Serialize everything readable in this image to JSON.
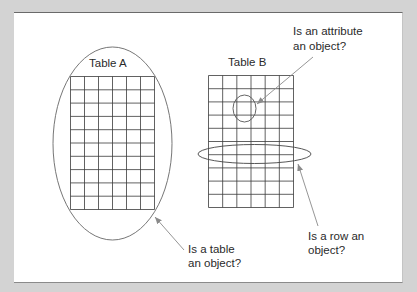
{
  "diagram": {
    "type": "conceptual-figure",
    "colors": {
      "background": "#d3d3d3",
      "panel": "#ffffff",
      "grid_line": "#3a3a3a",
      "ellipse_line": "#555555",
      "arrow_line": "#8a8a8a",
      "text": "#2a2a2a"
    },
    "table_a": {
      "title": "Table A",
      "columns": 6,
      "rows": 10
    },
    "table_b": {
      "title": "Table B",
      "columns": 6,
      "rows": 10
    },
    "annotations": {
      "attribute": {
        "line1": "Is an attribute",
        "line2": "an object?"
      },
      "table": {
        "line1": "Is a table",
        "line2": "an object?"
      },
      "row": {
        "line1": "Is a row an",
        "line2": "object?"
      }
    }
  }
}
